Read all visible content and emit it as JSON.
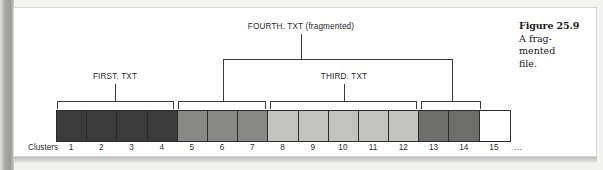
{
  "figure": {
    "number": "Figure 25.9",
    "caption_lines": [
      "A frag-",
      "mented",
      "file."
    ],
    "caption_full": "A fragmented file."
  },
  "diagram": {
    "axis_label": "Clusters",
    "ellipsis": "…",
    "labels": {
      "first": "FIRST. TXT",
      "third": "THIRD. TXT",
      "fourth": "FOURTH. TXT (fragmented)"
    }
  },
  "chart_data": {
    "type": "table",
    "xlabel": "Clusters",
    "categories": [
      "1",
      "2",
      "3",
      "4",
      "5",
      "6",
      "7",
      "8",
      "9",
      "10",
      "11",
      "12",
      "13",
      "14",
      "15"
    ],
    "cells": [
      {
        "cluster": "1",
        "file": "FIRST. TXT",
        "fill": "#3b3b3b"
      },
      {
        "cluster": "2",
        "file": "FIRST. TXT",
        "fill": "#3b3b3b"
      },
      {
        "cluster": "3",
        "file": "FIRST. TXT",
        "fill": "#3b3b3b"
      },
      {
        "cluster": "4",
        "file": "FIRST. TXT",
        "fill": "#3b3b3b"
      },
      {
        "cluster": "5",
        "file": "FOURTH. TXT",
        "fill": "#888886"
      },
      {
        "cluster": "6",
        "file": "FOURTH. TXT",
        "fill": "#888886"
      },
      {
        "cluster": "7",
        "file": "FOURTH. TXT",
        "fill": "#888886"
      },
      {
        "cluster": "8",
        "file": "THIRD. TXT",
        "fill": "#c2c2bf"
      },
      {
        "cluster": "9",
        "file": "THIRD. TXT",
        "fill": "#c2c2bf"
      },
      {
        "cluster": "10",
        "file": "THIRD. TXT",
        "fill": "#c2c2bf"
      },
      {
        "cluster": "11",
        "file": "THIRD. TXT",
        "fill": "#c2c2bf"
      },
      {
        "cluster": "12",
        "file": "THIRD. TXT",
        "fill": "#c2c2bf"
      },
      {
        "cluster": "13",
        "file": "FOURTH. TXT",
        "fill": "#6e6e6c"
      },
      {
        "cluster": "14",
        "file": "FOURTH. TXT",
        "fill": "#6e6e6c"
      },
      {
        "cluster": "15",
        "file": "",
        "fill": "#ffffff"
      }
    ],
    "brackets": [
      {
        "label": "FIRST. TXT",
        "spans": [
          [
            1,
            4
          ]
        ]
      },
      {
        "label": "FOURTH. TXT (fragmented)",
        "spans": [
          [
            5,
            7
          ],
          [
            13,
            14
          ]
        ]
      },
      {
        "label": "THIRD. TXT",
        "spans": [
          [
            8,
            12
          ]
        ]
      }
    ],
    "legend": [],
    "grid": false
  }
}
